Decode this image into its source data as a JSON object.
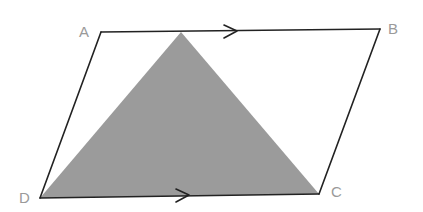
{
  "diagram": {
    "type": "parallelogram-with-shaded-triangle",
    "colors": {
      "edge": "#222222",
      "shading": "#9b9b9b",
      "label": "#9a9a9a",
      "background": "#ffffff"
    },
    "vertices": {
      "A": {
        "label": "A",
        "x": 101,
        "y": 32
      },
      "B": {
        "label": "B",
        "x": 380,
        "y": 29
      },
      "C": {
        "label": "C",
        "x": 319,
        "y": 194
      },
      "D": {
        "label": "D",
        "x": 40,
        "y": 198
      }
    },
    "labels": {
      "A": "A",
      "B": "B",
      "C": "C",
      "D": "D"
    },
    "shaded_triangle": {
      "apex_on": "AB",
      "apex": {
        "x": 181,
        "y": 31
      },
      "base": [
        "D",
        "C"
      ]
    },
    "parallel_markers": [
      {
        "edge": "AB",
        "direction": "right",
        "tip": {
          "x": 237,
          "y": 31
        }
      },
      {
        "edge": "DC",
        "direction": "right",
        "tip": {
          "x": 189,
          "y": 195
        }
      }
    ]
  }
}
